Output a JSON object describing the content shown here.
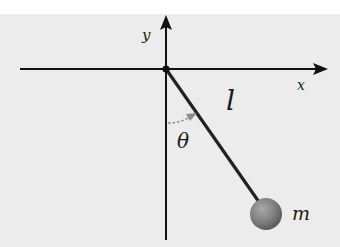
{
  "diagram": {
    "labels": {
      "x_axis": "x",
      "y_axis": "y",
      "length": "l",
      "angle": "θ",
      "mass": "m"
    },
    "colors": {
      "background": "#ececec",
      "axes": "#111111",
      "rod": "#222222",
      "angle_arrow": "#8c8c8c",
      "bob": "#7a7a7a"
    }
  }
}
